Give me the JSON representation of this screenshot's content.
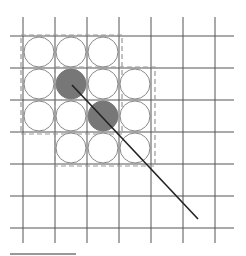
{
  "diagram": {
    "width": 246,
    "height": 256,
    "grid": {
      "vertical_x": [
        23,
        55,
        87,
        119,
        151,
        183,
        215
      ],
      "vertical_y_range": [
        17,
        243
      ],
      "horizontal_y": [
        36,
        68,
        100,
        132,
        164,
        196,
        228
      ],
      "horizontal_x_range": [
        10,
        234
      ],
      "cell_size": 32,
      "color": "#555555"
    },
    "circles": {
      "radius": 15,
      "stroke": "#888888",
      "empty_fill": "#ffffff",
      "filled_fill": "#777777",
      "cells": [
        {
          "row": 0,
          "col": 0,
          "filled": false
        },
        {
          "row": 0,
          "col": 1,
          "filled": false
        },
        {
          "row": 0,
          "col": 2,
          "filled": false
        },
        {
          "row": 1,
          "col": 0,
          "filled": false
        },
        {
          "row": 1,
          "col": 1,
          "filled": true
        },
        {
          "row": 1,
          "col": 2,
          "filled": false
        },
        {
          "row": 1,
          "col": 3,
          "filled": false
        },
        {
          "row": 2,
          "col": 0,
          "filled": false
        },
        {
          "row": 2,
          "col": 1,
          "filled": false
        },
        {
          "row": 2,
          "col": 2,
          "filled": true
        },
        {
          "row": 2,
          "col": 3,
          "filled": false
        },
        {
          "row": 3,
          "col": 1,
          "filled": false
        },
        {
          "row": 3,
          "col": 2,
          "filled": false
        },
        {
          "row": 3,
          "col": 3,
          "filled": false
        }
      ]
    },
    "dashed_rects": [
      {
        "x": 21,
        "y": 35,
        "w": 101,
        "h": 99
      },
      {
        "x": 55,
        "y": 67,
        "w": 100,
        "h": 99
      }
    ],
    "dashed_color": "#999999",
    "ray": {
      "x1": 72,
      "y1": 85,
      "x2": 198,
      "y2": 219,
      "color": "#222222"
    },
    "scale_bar": {
      "x1": 10,
      "x2": 76,
      "y": 254,
      "color": "#333333"
    }
  }
}
